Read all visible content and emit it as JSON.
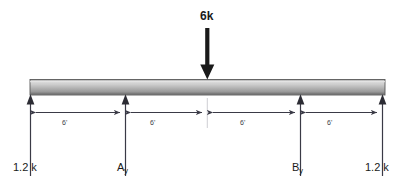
{
  "figure": {
    "background_color": "#ffffff",
    "beam": {
      "label": "beam",
      "fill_light": "#d9d9d9",
      "fill_dark": "#8a8a8a",
      "outline_color": "#4a4a4a"
    },
    "applied_load": {
      "label": "6k",
      "direction": "down",
      "color": "#1a1a1a"
    },
    "dimensions": [
      {
        "label": "6'"
      },
      {
        "label": "6'"
      },
      {
        "label": "6'"
      },
      {
        "label": "6'"
      }
    ],
    "reactions": [
      {
        "label": "1.2 k",
        "subscript": "",
        "direction": "up"
      },
      {
        "label": "A",
        "subscript": "y",
        "direction": "up"
      },
      {
        "label": "B",
        "subscript": "y",
        "direction": "up"
      },
      {
        "label": "1.2 k",
        "subscript": "",
        "direction": "up"
      }
    ],
    "line_color": "#3a3a46"
  }
}
